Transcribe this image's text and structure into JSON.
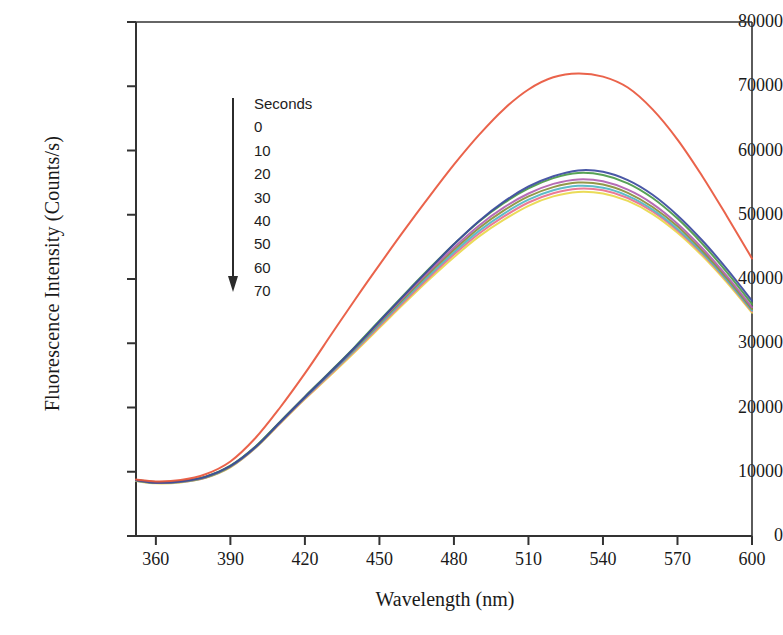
{
  "figure": {
    "title": "",
    "y_axis_title": "Fluorescence Intensity (Counts/s)",
    "x_axis_title": "Wavelength (nm)"
  },
  "legend": {
    "header": "Seconds",
    "arrow_icon": "down-arrow-icon",
    "entries": [
      "0",
      "10",
      "20",
      "30",
      "40",
      "50",
      "60",
      "70"
    ]
  },
  "chart_data": {
    "type": "line",
    "title": "",
    "xlabel": "Wavelength (nm)",
    "ylabel": "Fluorescence Intensity (Counts/s)",
    "xlim": [
      352,
      600
    ],
    "ylim": [
      0,
      80000
    ],
    "xticks": [
      360,
      390,
      420,
      450,
      480,
      510,
      540,
      570,
      600
    ],
    "yticks": [
      0,
      10000,
      20000,
      30000,
      40000,
      50000,
      60000,
      70000,
      80000
    ],
    "grid": false,
    "legend_position": "inside-upper-left",
    "legend_title": "Seconds",
    "annotation": "Arrow indicates decreasing intensity with increasing time (0 to 70 seconds)",
    "x": [
      352,
      360,
      370,
      380,
      390,
      400,
      410,
      420,
      430,
      440,
      450,
      460,
      470,
      480,
      490,
      500,
      510,
      520,
      530,
      540,
      550,
      560,
      570,
      580,
      590,
      600
    ],
    "series": [
      {
        "name": "0",
        "color": "#e8563c",
        "values": [
          8800,
          8500,
          8700,
          9600,
          11600,
          15200,
          20000,
          25300,
          31000,
          36700,
          42200,
          47600,
          52800,
          57800,
          62400,
          66400,
          69500,
          71400,
          72000,
          71500,
          69800,
          66400,
          61700,
          56000,
          49700,
          43200
        ]
      },
      {
        "name": "10",
        "color": "#3b4a9e",
        "values": [
          8700,
          8300,
          8500,
          9200,
          10900,
          13800,
          17700,
          21600,
          25400,
          29300,
          33400,
          37500,
          41500,
          45400,
          49000,
          52000,
          54400,
          56000,
          56900,
          56700,
          55400,
          53100,
          49900,
          46000,
          41500,
          36600
        ]
      },
      {
        "name": "20",
        "color": "#4a9a48",
        "values": [
          8750,
          8400,
          8550,
          9250,
          10950,
          13900,
          17800,
          21700,
          25500,
          29400,
          33500,
          37600,
          41600,
          45400,
          48900,
          51800,
          54100,
          55700,
          56500,
          56200,
          54900,
          52600,
          49400,
          45500,
          41000,
          36100
        ]
      },
      {
        "name": "30",
        "color": "#b05fb0",
        "values": [
          8700,
          8350,
          8500,
          9200,
          10900,
          13850,
          17750,
          21650,
          25450,
          29300,
          33300,
          37300,
          41200,
          44900,
          48300,
          51100,
          53300,
          54800,
          55500,
          55200,
          53900,
          51700,
          48600,
          44800,
          40400,
          35600
        ]
      },
      {
        "name": "40",
        "color": "#8a8f3a",
        "values": [
          8650,
          8300,
          8450,
          9150,
          10850,
          13800,
          17700,
          21600,
          25350,
          29150,
          33100,
          37050,
          40900,
          44550,
          47900,
          50650,
          52850,
          54300,
          55000,
          54700,
          53400,
          51200,
          48200,
          44400,
          40100,
          35300
        ]
      },
      {
        "name": "50",
        "color": "#4fb6c4",
        "values": [
          8600,
          8250,
          8400,
          9100,
          10800,
          13750,
          17650,
          21500,
          25200,
          28950,
          32850,
          36750,
          40550,
          44150,
          47450,
          50150,
          52350,
          53800,
          54500,
          54200,
          52950,
          50800,
          47800,
          44100,
          39800,
          35100
        ]
      },
      {
        "name": "60",
        "color": "#e86f8e",
        "values": [
          8600,
          8250,
          8400,
          9080,
          10750,
          13700,
          17550,
          21400,
          25050,
          28800,
          32650,
          36500,
          40250,
          43800,
          47050,
          49700,
          51900,
          53350,
          54050,
          53800,
          52600,
          50500,
          47550,
          43900,
          39650,
          34950
        ]
      },
      {
        "name": "70",
        "color": "#e8d84a",
        "values": [
          8550,
          8200,
          8350,
          9050,
          10700,
          13650,
          17500,
          21300,
          24900,
          28600,
          32400,
          36200,
          39900,
          43400,
          46600,
          49200,
          51400,
          52850,
          53550,
          53300,
          52150,
          50100,
          47200,
          43600,
          39400,
          34750
        ]
      }
    ]
  }
}
